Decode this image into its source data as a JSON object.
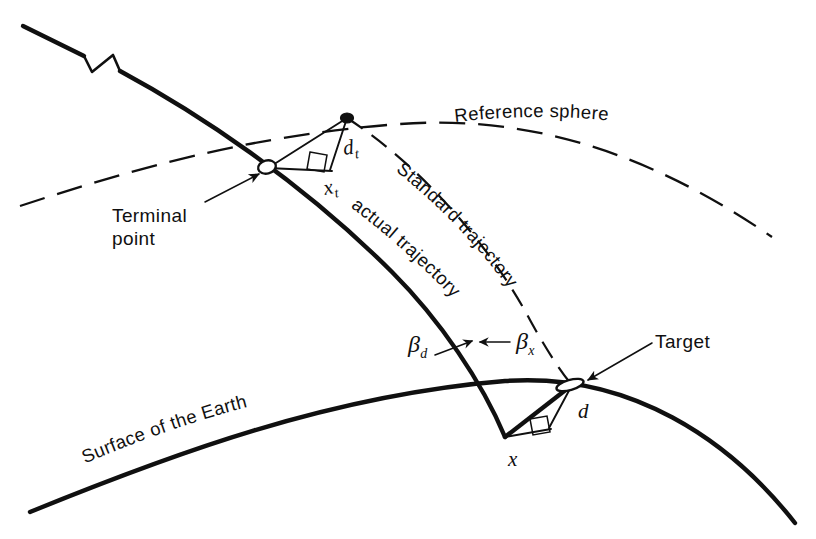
{
  "figure": {
    "kind": "technical-line-diagram",
    "background_color": "#ffffff",
    "ink_color": "#101010",
    "labels": {
      "reference_sphere": "Reference sphere",
      "standard_trajectory": "Standard trajectory",
      "actual_trajectory": "actual trajectory",
      "surface_of_the_earth": "Surface of the Earth",
      "terminal_point_line1": "Terminal",
      "terminal_point_line2": "point",
      "target": "Target"
    },
    "symbols": {
      "d_t_base": "d",
      "d_t_sub": "t",
      "x_t_base": "x",
      "x_t_sub": "t",
      "d_base": "d",
      "x_base": "x",
      "beta_d_base": "β",
      "beta_d_sub": "d",
      "beta_x_base": "β",
      "beta_x_sub": "x"
    },
    "curves": {
      "earth_surface": {
        "name": "Surface of the Earth",
        "style": "solid-thick",
        "path": "M 30 512 C 170 455 330 395 505 381 C 630 372 730 440 795 523"
      },
      "reference_sphere": {
        "name": "Reference sphere",
        "style": "dashed",
        "path": "M 20 206 C 130 170 250 135 400 124 C 540 114 660 160 772 237"
      },
      "actual_trajectory": {
        "name": "actual trajectory",
        "style": "solid-thick",
        "segments": [
          "M 23 26 L 84 56",
          "M 84 56 L 92 70 L 112 56 L 118 70",
          "M 118 70 C 190 108 300 178 392 270 C 440 318 480 380 505 437",
          "M 505 437 L 572 385"
        ]
      },
      "standard_trajectory": {
        "name": "Standard trajectory",
        "style": "dashed",
        "path": "M 347 118 C 420 165 490 245 530 320 C 552 360 566 378 572 385"
      }
    },
    "terminal_triangle": {
      "apex_on_sphere": [
        347,
        118
      ],
      "terminal_point": [
        268,
        168
      ],
      "right_angle_corner": [
        330,
        170
      ],
      "edges": [
        "M 268 168 L 347 118",
        "M 347 118 L 330 170",
        "M 268 168 L 330 170"
      ]
    },
    "target_triangle": {
      "target_point": [
        572,
        385
      ],
      "vertex": [
        505,
        437
      ],
      "right_angle_corner": [
        548,
        427
      ],
      "edges": [
        "M 505 437 L 572 385",
        "M 572 385 L 548 427",
        "M 505 437 L 548 427"
      ]
    },
    "annotations": {
      "terminal_point_leader": "M 208 200 L 262 173",
      "target_leader": "M 648 345 L 586 380",
      "beta_d_arrow": "M 437 352 L 470 342",
      "beta_x_arrow": "M 505 345 L 475 345"
    }
  }
}
